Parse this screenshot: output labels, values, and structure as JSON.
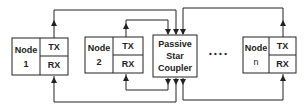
{
  "diagram": {
    "type": "passive-star-network",
    "nodes": [
      {
        "label": "Node",
        "id": "1",
        "tx": "TX",
        "rx": "RX"
      },
      {
        "label": "Node",
        "id": "2",
        "tx": "TX",
        "rx": "RX"
      },
      {
        "label": "Node",
        "id": "n",
        "tx": "TX",
        "rx": "RX"
      }
    ],
    "coupler": {
      "line1": "Passive",
      "line2": "Star",
      "line3": "Coupler"
    },
    "ellipsis": "• • • •",
    "colors": {
      "stroke": "#222222",
      "fill": "#ffffff"
    }
  }
}
